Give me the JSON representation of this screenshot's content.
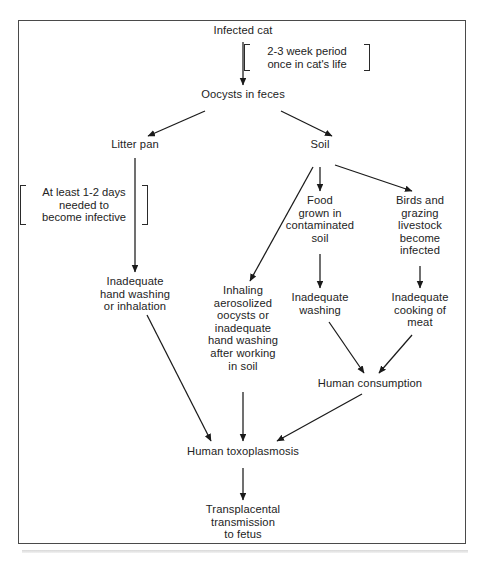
{
  "figure": {
    "frame_color": "#4a4a4a",
    "text_color": "#232323",
    "line_color": "#1a1a1a",
    "background": "#ffffff"
  },
  "nodes": {
    "infected_cat": "Infected cat",
    "oocysts_in_feces": "Oocysts in feces",
    "litter_pan": "Litter pan",
    "soil": "Soil",
    "food_grown": "Food\ngrown in\ncontaminated\nsoil",
    "birds_livestock": "Birds and\ngrazing\nlivestock\nbecome\ninfected",
    "inadequate_hand_washing": "Inadequate\nhand washing\nor inhalation",
    "inhaling_aerosolized": "Inhaling\naerosolized\noocysts or\ninadequate\nhand washing\nafter working\nin soil",
    "inadequate_washing": "Inadequate\nwashing",
    "inadequate_cooking": "Inadequate\ncooking of\nmeat",
    "human_consumption": "Human consumption",
    "human_toxoplasmosis": "Human toxoplasmosis",
    "transplacental": "Transplacental\ntransmission\nto fetus"
  },
  "notes": {
    "cat_period": "2-3 week period\nonce in cat's life",
    "infective_delay": "At least 1-2 days\nneeded to\nbecome infective"
  },
  "edges": [
    {
      "from": "infected_cat",
      "to": "oocysts_in_feces",
      "style": "straight-down"
    },
    {
      "from": "oocysts_in_feces",
      "to": "litter_pan",
      "style": "diagonal-left"
    },
    {
      "from": "oocysts_in_feces",
      "to": "soil",
      "style": "diagonal-right"
    },
    {
      "from": "litter_pan",
      "to": "inadequate_hand_washing",
      "style": "straight-down"
    },
    {
      "from": "soil",
      "to": "inhaling_aerosolized",
      "style": "diagonal-left"
    },
    {
      "from": "soil",
      "to": "food_grown",
      "style": "straight-down"
    },
    {
      "from": "soil",
      "to": "birds_livestock",
      "style": "diagonal-right"
    },
    {
      "from": "food_grown",
      "to": "inadequate_washing",
      "style": "straight-down"
    },
    {
      "from": "birds_livestock",
      "to": "inadequate_cooking",
      "style": "straight-down"
    },
    {
      "from": "inadequate_washing",
      "to": "human_consumption",
      "style": "diagonal-right"
    },
    {
      "from": "inadequate_cooking",
      "to": "human_consumption",
      "style": "diagonal-left"
    },
    {
      "from": "inadequate_hand_washing",
      "to": "human_toxoplasmosis",
      "style": "diagonal-right"
    },
    {
      "from": "inhaling_aerosolized",
      "to": "human_toxoplasmosis",
      "style": "straight-down"
    },
    {
      "from": "human_consumption",
      "to": "human_toxoplasmosis",
      "style": "diagonal-left"
    },
    {
      "from": "human_toxoplasmosis",
      "to": "transplacental",
      "style": "straight-down"
    }
  ]
}
